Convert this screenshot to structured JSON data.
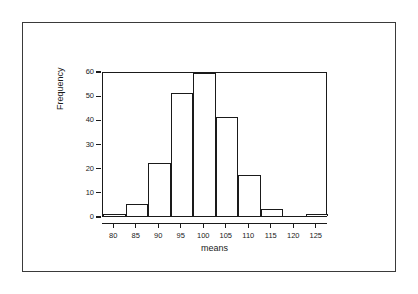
{
  "chart_data": {
    "type": "bar",
    "title": "",
    "subtitle": "",
    "xlabel": "means",
    "ylabel": "Frequency",
    "grid": false,
    "legend": null,
    "xlim": [
      77.5,
      127.5
    ],
    "ylim": [
      0,
      60
    ],
    "bin_width": 5,
    "x_ticks": [
      80,
      85,
      90,
      95,
      100,
      105,
      110,
      115,
      120,
      125
    ],
    "y_ticks": [
      0,
      10,
      20,
      30,
      40,
      50,
      60
    ],
    "categories": [
      "77.5-82.5",
      "82.5-87.5",
      "87.5-92.5",
      "92.5-97.5",
      "97.5-102.5",
      "102.5-107.5",
      "107.5-112.5",
      "112.5-117.5",
      "117.5-122.5",
      "122.5-127.5"
    ],
    "bin_edges": [
      77.5,
      82.5,
      87.5,
      92.5,
      97.5,
      102.5,
      107.5,
      112.5,
      117.5,
      122.5,
      127.5
    ],
    "values": [
      1,
      5,
      22,
      51,
      59,
      41,
      17,
      3,
      0,
      1
    ],
    "bar_fill": "#ffffff",
    "bar_stroke": "#1a1a1a",
    "axis_color": "#1a1a1a",
    "background": "#ffffff",
    "border_color": "#3a3a3a"
  },
  "figure": {
    "outer_border_color": "#3a3a3a"
  }
}
